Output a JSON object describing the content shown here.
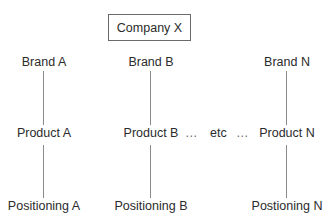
{
  "root": {
    "label": "Company X"
  },
  "columns": [
    {
      "brand": "Brand A",
      "product": "Product A",
      "positioning": "Positioning A"
    },
    {
      "brand": "Brand B",
      "product": "Product B",
      "positioning": "Positioning B"
    },
    {
      "brand": "Brand N",
      "product": "Product N",
      "positioning": "Postioning N"
    }
  ],
  "continuation": {
    "ellipsis_left": "…",
    "etc": "etc",
    "ellipsis_right": "…"
  },
  "colors": {
    "text": "#2b2b2b",
    "box_border": "#6a6a6a",
    "connector": "#8a8a8a",
    "background": "#ffffff"
  }
}
